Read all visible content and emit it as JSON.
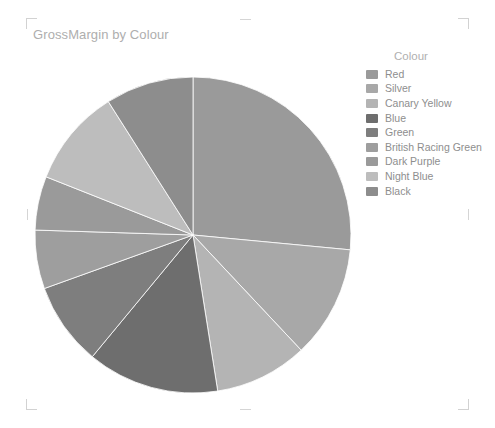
{
  "visual": {
    "title": "GrossMargin by Colour",
    "background": "#ffffff",
    "title_color": "#aeaeae",
    "handle_color": "#d2d2d2"
  },
  "legend": {
    "title": "Colour",
    "title_color": "#b0b0b0",
    "label_color": "#8e8e8e",
    "position": "right",
    "items": [
      {
        "label": "Red",
        "color": "#9a9a9a"
      },
      {
        "label": "Silver",
        "color": "#a8a8a8"
      },
      {
        "label": "Canary Yellow",
        "color": "#b4b4b4"
      },
      {
        "label": "Blue",
        "color": "#6e6e6e"
      },
      {
        "label": "Green",
        "color": "#7e7e7e"
      },
      {
        "label": "British Racing Green",
        "color": "#9e9e9e"
      },
      {
        "label": "Dark Purple",
        "color": "#9a9a9a"
      },
      {
        "label": "Night Blue",
        "color": "#bdbdbd"
      },
      {
        "label": "Black",
        "color": "#8d8d8d"
      }
    ]
  },
  "chart_data": {
    "type": "pie",
    "title": "GrossMargin by Colour",
    "legend_title": "Colour",
    "start_angle": 0,
    "direction": "clockwise",
    "center": {
      "x": 193,
      "y": 235
    },
    "radius": 158,
    "categories": [
      "Red",
      "Silver",
      "Canary Yellow",
      "Blue",
      "Green",
      "British Racing Green",
      "Dark Purple",
      "Night Blue",
      "Black"
    ],
    "values": [
      26.5,
      11.5,
      9.5,
      13.5,
      8.5,
      6.0,
      5.5,
      10.0,
      9.0
    ],
    "percentages": [
      26.5,
      11.5,
      9.5,
      13.5,
      8.5,
      6.0,
      5.5,
      10.0,
      9.0
    ],
    "colors": [
      "#9a9a9a",
      "#a8a8a8",
      "#b4b4b4",
      "#6e6e6e",
      "#7e7e7e",
      "#9e9e9e",
      "#9a9a9a",
      "#bdbdbd",
      "#8d8d8d"
    ],
    "slice_angles_deg": [
      95.4,
      41.4,
      34.2,
      48.6,
      30.6,
      21.6,
      19.8,
      36.0,
      32.4
    ],
    "xlabel": "",
    "ylabel": "GrossMargin",
    "grid": false
  }
}
